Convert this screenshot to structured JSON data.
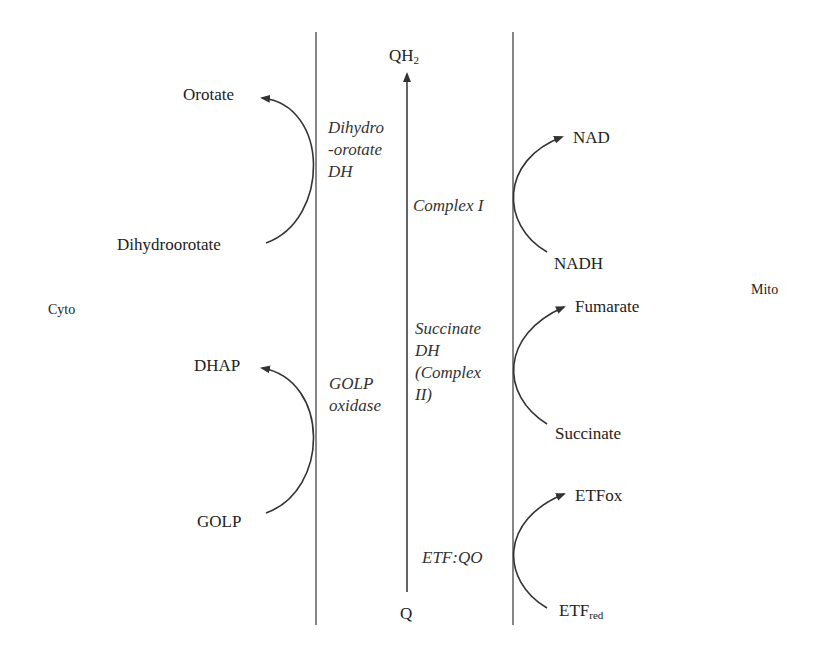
{
  "compartments": {
    "left": "Cyto",
    "right": "Mito"
  },
  "quinone": {
    "top": "QH",
    "top_sub": "2",
    "bottom": "Q"
  },
  "enzymes": {
    "dhodh": "Dihydro\n-orotate\nDH",
    "golp": "GOLP\noxidase",
    "complex1": "Complex I",
    "complex2": "Succinate\nDH\n(Complex\nII)",
    "etfqo": "ETF:QO"
  },
  "left_reactions": [
    {
      "substrate": "Dihydroorotate",
      "product": "Orotate"
    },
    {
      "substrate": "GOLP",
      "product": "DHAP"
    }
  ],
  "right_reactions": [
    {
      "substrate": "NADH",
      "product": "NAD"
    },
    {
      "substrate": "Succinate",
      "product": "Fumarate"
    },
    {
      "substrate": "ETF",
      "substrate_sub": "red",
      "product": "ETFox"
    }
  ],
  "colors": {
    "line": "#333333",
    "text": "#222222",
    "background": "#ffffff"
  }
}
